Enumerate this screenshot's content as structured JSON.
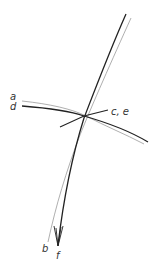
{
  "diagram": {
    "labels": {
      "a": "a",
      "d": "d",
      "ce": "c, e",
      "b": "b",
      "f": "f"
    },
    "colors": {
      "thick_line": "#222222",
      "thin_line": "#999999",
      "label": "#333333",
      "background": "#ffffff"
    }
  }
}
